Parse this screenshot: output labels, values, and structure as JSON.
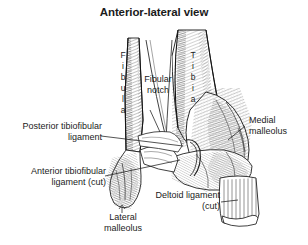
{
  "figure": {
    "title": "Anterior-lateral view",
    "background_color": "#ffffff",
    "ink_color": "#1b1b1b",
    "view_type": "anterior-lateral"
  },
  "bone_labels": {
    "fibula": "Fibula",
    "tibia": "Tibia"
  },
  "labels": {
    "fibular_notch": "Fibular\nnotch",
    "posterior_tibiofibular_ligament": "Posterior tibiofibular\nligament",
    "anterior_tibiofibular_ligament_cut": "Anterior tibiofibular\nligament (cut)",
    "medial_malleolus": "Medial\nmalleolus",
    "lateral_malleolus": "Lateral\nmalleolus",
    "deltoid_ligament_cut": "Deltoid ligament\n(cut)"
  }
}
